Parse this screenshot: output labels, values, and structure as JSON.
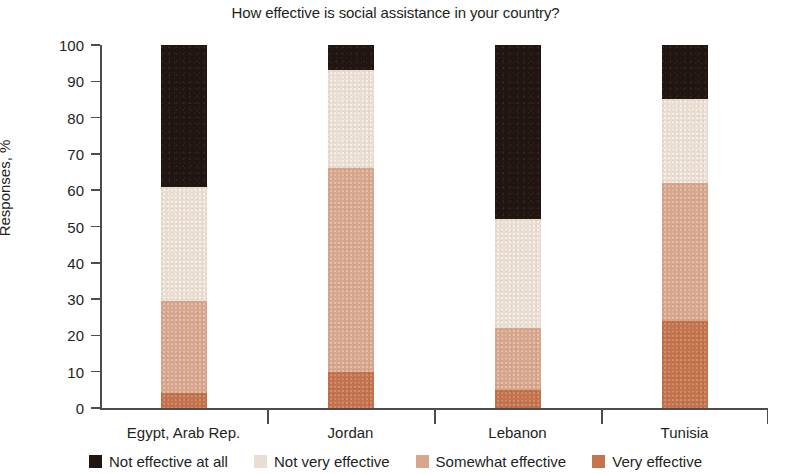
{
  "chart_data": {
    "type": "bar",
    "subtype": "100% stacked column",
    "title": "How effective is social assistance in your country?",
    "xlabel": "",
    "ylabel": "Responses, %",
    "ylim": [
      0,
      100
    ],
    "ytick_step": 10,
    "yticks": [
      0,
      10,
      20,
      30,
      40,
      50,
      60,
      70,
      80,
      90,
      100
    ],
    "ytick_labels": [
      "0",
      "10",
      "20",
      "30",
      "40",
      "50",
      "60",
      "70",
      "80",
      "90",
      "100"
    ],
    "grid": false,
    "legend_position": "bottom",
    "categories": [
      "Egypt, Arab Rep.",
      "Jordan",
      "Lebanon",
      "Tunisia"
    ],
    "series": [
      {
        "name": "Very effective",
        "color": "#c4734d",
        "values": [
          4,
          10,
          5,
          24
        ]
      },
      {
        "name": "Somewhat effective",
        "color": "#d8a68d",
        "values": [
          25.5,
          56,
          17,
          38
        ]
      },
      {
        "name": "Not very effective",
        "color": "#e9ded1",
        "values": [
          31.5,
          27,
          30,
          23
        ]
      },
      {
        "name": "Not effective at all",
        "color": "#201510",
        "values": [
          39,
          7,
          48,
          15
        ]
      }
    ],
    "stack_order_bottom_to_top": [
      "Very effective",
      "Somewhat effective",
      "Not very effective",
      "Not effective at all"
    ],
    "cumulative_tops": {
      "Egypt, Arab Rep.": [
        4,
        29.5,
        61,
        100
      ],
      "Jordan": [
        10,
        66,
        93,
        100
      ],
      "Lebanon": [
        5,
        22,
        52,
        100
      ],
      "Tunisia": [
        24,
        62,
        85,
        100
      ]
    }
  },
  "legend": {
    "items": [
      {
        "label": "Not effective at all",
        "swatch": "legend-swatch-not-effective-at-all",
        "color": "#201510"
      },
      {
        "label": "Not very effective",
        "swatch": "legend-swatch-not-very-effective",
        "color": "#e9ded1"
      },
      {
        "label": "Somewhat effective",
        "swatch": "legend-swatch-somewhat-effective",
        "color": "#d8a68d"
      },
      {
        "label": "Very effective",
        "swatch": "legend-swatch-very-effective",
        "color": "#c4734d"
      }
    ]
  }
}
